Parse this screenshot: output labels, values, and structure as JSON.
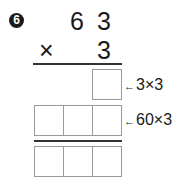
{
  "problem": {
    "number_label": "6",
    "multiplicand": [
      "6",
      "3"
    ],
    "operator": "×",
    "multiplier": "3",
    "partial_rows": [
      {
        "boxes": 1,
        "hint_arrow": "←",
        "hint": "3×3"
      },
      {
        "boxes": 3,
        "hint_arrow": "←",
        "hint": "60×3"
      }
    ],
    "result_boxes": 3
  }
}
